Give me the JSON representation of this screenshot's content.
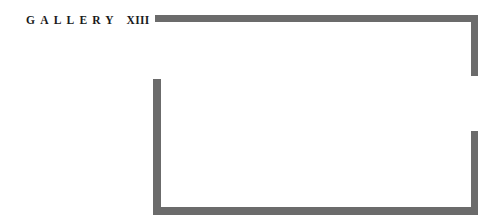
{
  "room": {
    "label_word": "GALLERY",
    "label_number": "XIII",
    "wall_color": "#6b6b6b",
    "openings": [
      "upper-left (west wall top)",
      "right side (east wall middle)"
    ]
  }
}
